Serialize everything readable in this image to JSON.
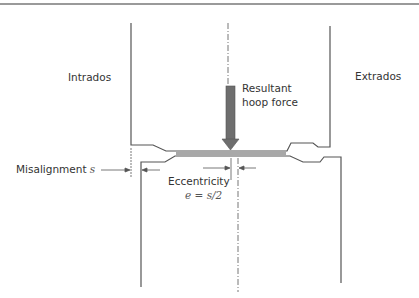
{
  "labels": {
    "intrados": "Intrados",
    "extrados": "Extrados",
    "resultant_line1": "Resultant",
    "resultant_line2": "hoop force",
    "misalignment": "Misalignment",
    "misalignment_symbol": "s",
    "eccentricity": "Eccentricity",
    "eccentricity_formula": "e = s/2"
  },
  "colors": {
    "outline": "#555555",
    "arrow_fill": "#6e6e6e",
    "band_fill": "#a8a8a8",
    "text": "#333333",
    "rule": "#9a9a9a"
  }
}
